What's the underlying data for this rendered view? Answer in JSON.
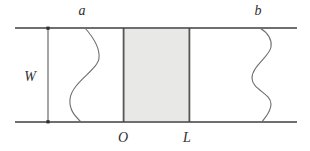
{
  "diagram": {
    "labels": {
      "left_wire": "a",
      "right_wire": "b",
      "width_dimension": "W",
      "region_left": "O",
      "region_right": "L"
    },
    "colors": {
      "background": "#ffffff",
      "rail": "#3f3f3f",
      "dimension_line": "#4a4a4a",
      "dimension_dot": "#2e2e2e",
      "wire_curve": "#6e6e6e",
      "region_fill": "#e8e8e6",
      "region_border": "#565656"
    }
  }
}
